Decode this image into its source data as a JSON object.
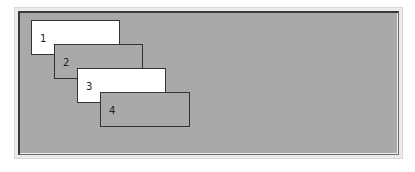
{
  "canvas": {
    "background": "#a9a9a9",
    "windows": [
      {
        "label": "1",
        "fill": "#ffffff",
        "x": 11,
        "y": 7,
        "w": 89,
        "h": 35
      },
      {
        "label": "2",
        "fill": "#a9a9a9",
        "x": 34,
        "y": 31,
        "w": 89,
        "h": 35
      },
      {
        "label": "3",
        "fill": "#ffffff",
        "x": 57,
        "y": 55,
        "w": 89,
        "h": 35
      },
      {
        "label": "4",
        "fill": "#a9a9a9",
        "x": 80,
        "y": 79,
        "w": 90,
        "h": 35
      }
    ]
  }
}
